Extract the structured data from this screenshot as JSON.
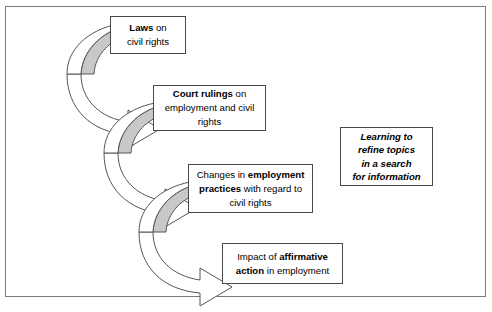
{
  "diagram": {
    "frame": {
      "border_color": "#7b7b7b"
    },
    "arrow_style": {
      "top_band_fill": "#c8c8c8",
      "body_fill": "#ffffff",
      "stroke": "#555555"
    },
    "nodes": [
      {
        "id": "laws",
        "name": "laws-box",
        "lines": [
          [
            {
              "text": "Laws",
              "bold": true
            },
            {
              "text": " on",
              "bold": false
            }
          ],
          [
            {
              "text": "civil rights",
              "bold": false
            }
          ]
        ],
        "plain": "Laws on civil rights"
      },
      {
        "id": "court",
        "name": "court-rulings-box",
        "lines": [
          [
            {
              "text": "Court rulings",
              "bold": true
            },
            {
              "text": " on",
              "bold": false
            }
          ],
          [
            {
              "text": "employment and civil",
              "bold": false
            }
          ],
          [
            {
              "text": "rights",
              "bold": false
            }
          ]
        ],
        "plain": "Court rulings on employment and civil rights"
      },
      {
        "id": "changes",
        "name": "employment-practices-box",
        "lines": [
          [
            {
              "text": "Changes in ",
              "bold": false
            },
            {
              "text": "employment",
              "bold": true
            }
          ],
          [
            {
              "text": "practices",
              "bold": true
            },
            {
              "text": " with regard to",
              "bold": false
            }
          ],
          [
            {
              "text": "civil rights",
              "bold": false
            }
          ]
        ],
        "plain": "Changes in employment practices with regard to civil rights"
      },
      {
        "id": "impact",
        "name": "affirmative-action-box",
        "lines": [
          [
            {
              "text": "Impact of ",
              "bold": false
            },
            {
              "text": "affirmative",
              "bold": true
            }
          ],
          [
            {
              "text": "action",
              "bold": true
            },
            {
              "text": " in employment",
              "bold": false
            }
          ]
        ],
        "plain": "Impact of affirmative action in employment"
      }
    ],
    "aside": {
      "id": "aside",
      "name": "learning-callout-box",
      "lines": [
        [
          {
            "text": "Learning to",
            "bold": true
          }
        ],
        [
          {
            "text": "refine topics",
            "bold": true
          }
        ],
        [
          {
            "text": "in a search",
            "bold": true
          }
        ],
        [
          {
            "text": "for information",
            "bold": true
          }
        ]
      ],
      "plain": "Learning to refine topics in a search for information"
    },
    "connectors": [
      {
        "id": "arrow-1",
        "name": "curved-arrow-laws-to-court",
        "from": "laws",
        "to": "court"
      },
      {
        "id": "arrow-2",
        "name": "curved-arrow-court-to-changes",
        "from": "court",
        "to": "changes"
      },
      {
        "id": "arrow-3",
        "name": "curved-arrow-changes-to-impact",
        "from": "changes",
        "to": "impact"
      }
    ]
  }
}
